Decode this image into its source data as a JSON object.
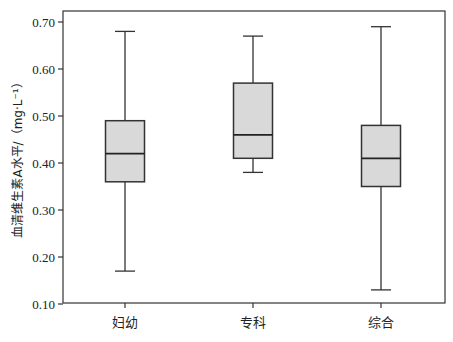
{
  "chart_data": {
    "type": "boxplot",
    "title": "",
    "xlabel": "",
    "ylabel": "血清维生素A水平/（mg·L⁻¹）",
    "ylim": [
      0.1,
      0.7
    ],
    "yticks": [
      "0.10",
      "0.20",
      "0.30",
      "0.40",
      "0.50",
      "0.60",
      "0.70"
    ],
    "grid": false,
    "legend": null,
    "categories": [
      "妇幼",
      "专科",
      "综合"
    ],
    "series": [
      {
        "name": "妇幼",
        "whisker_low": 0.17,
        "q1": 0.36,
        "median": 0.42,
        "q3": 0.49,
        "whisker_high": 0.68
      },
      {
        "name": "专科",
        "whisker_low": 0.38,
        "q1": 0.41,
        "median": 0.46,
        "q3": 0.57,
        "whisker_high": 0.67
      },
      {
        "name": "综合",
        "whisker_low": 0.13,
        "q1": 0.35,
        "median": 0.41,
        "q3": 0.48,
        "whisker_high": 0.69
      }
    ],
    "colors": {
      "box_fill": "#d9d9d9",
      "line": "#333333"
    }
  }
}
